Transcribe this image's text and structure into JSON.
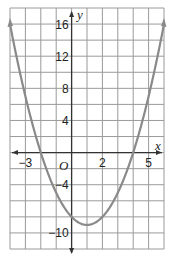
{
  "chart_data": {
    "type": "line",
    "title": "",
    "xlabel": "x",
    "ylabel": "y",
    "origin_label": "O",
    "function": "y = x^2 - 2x - 8",
    "xlim": [
      -4,
      6
    ],
    "ylim": [
      -12,
      18
    ],
    "grid": true,
    "grid_x_step": 1,
    "grid_y_step": 2,
    "x_tick_labels": [
      {
        "value": -3,
        "label": "−3"
      },
      {
        "value": 2,
        "label": "2"
      },
      {
        "value": 5,
        "label": "5"
      }
    ],
    "y_tick_labels": [
      {
        "value": 16,
        "label": "16"
      },
      {
        "value": 12,
        "label": "12"
      },
      {
        "value": 8,
        "label": "8"
      },
      {
        "value": 4,
        "label": "4"
      },
      {
        "value": -4,
        "label": "−4"
      },
      {
        "value": -10,
        "label": "−10"
      }
    ],
    "series": [
      {
        "name": "parabola",
        "color": "#8a8a8a",
        "x": [
          -4,
          -3,
          -2,
          -1,
          0,
          1,
          2,
          3,
          4,
          5,
          6
        ],
        "y": [
          16,
          7,
          0,
          -5,
          -8,
          -9,
          -8,
          -5,
          0,
          7,
          16
        ],
        "vertex": [
          1,
          -9
        ],
        "roots": [
          -2,
          4
        ],
        "arrows_at_ends": true
      }
    ],
    "colors": {
      "grid": "#9a9a9a",
      "axis": "#333333",
      "curve": "#8a8a8a"
    }
  }
}
